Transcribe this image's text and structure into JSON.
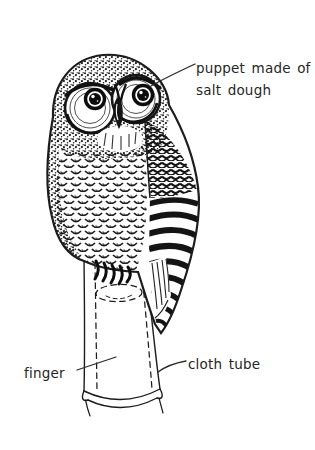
{
  "canvas": {
    "width": 315,
    "height": 450,
    "background": "#ffffff",
    "ink_color": "#1c1c1c",
    "text_color": "#262626"
  },
  "illustration": {
    "name": "owl-finger-puppet-drawing",
    "style": "pen-and-ink line illustration"
  },
  "labels": {
    "puppet": {
      "line1": "puppet made of",
      "line2": "salt dough"
    },
    "finger": "finger",
    "cloth_tube": "cloth tube"
  }
}
